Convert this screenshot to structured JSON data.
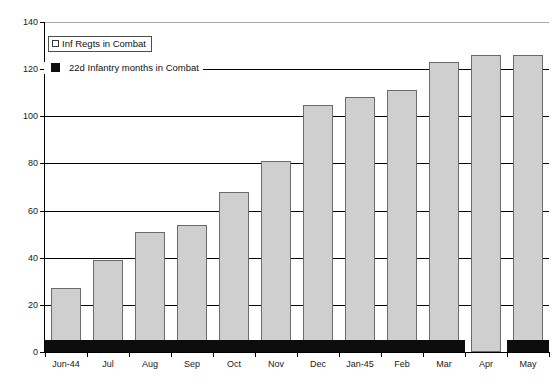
{
  "chart_data": {
    "type": "bar",
    "title": "",
    "subtitle": "",
    "xlabel": "",
    "ylabel": "",
    "ylim": [
      0,
      140
    ],
    "ytick_step": 20,
    "yticks": [
      0,
      20,
      40,
      60,
      80,
      100,
      120,
      140
    ],
    "ytick_labels": [
      "0",
      "20",
      "40",
      "60",
      "80",
      "100",
      "120",
      "140"
    ],
    "grid": true,
    "grid_axis": "y",
    "legend_position": "upper-left-inside",
    "categories": [
      "Jun-44",
      "Jul",
      "Aug",
      "Sep",
      "Oct",
      "Nov",
      "Dec",
      "Jan-45",
      "Feb",
      "Mar",
      "Apr",
      "May"
    ],
    "series": [
      {
        "name": "Inf Regts in Combat",
        "color": "#cfcfcf",
        "edge_color": "#6b6b6b",
        "values": [
          27,
          39,
          51,
          54,
          68,
          81,
          105,
          108,
          111,
          123,
          126,
          126
        ]
      },
      {
        "name": "22d Infantry months in Combat",
        "color": "#0d0d0d",
        "edge_color": "#0d0d0d",
        "values": [
          5,
          5,
          5,
          5,
          5,
          5,
          5,
          5,
          5,
          5,
          0,
          5
        ]
      }
    ]
  },
  "legend": {
    "boxed_entry": {
      "label": "Inf Regts in Combat",
      "swatch": "legend-swatch-open-square"
    },
    "plain_entry": {
      "label": "22d Infantry months in Combat",
      "swatch": "legend-swatch-filled-square"
    }
  },
  "colors": {
    "series_light": "#cfcfcf",
    "series_light_edge": "#6b6b6b",
    "series_dark": "#0d0d0d",
    "axis": "#000000",
    "grid": "#000000",
    "background": "#ffffff",
    "text": "#1a1a1a"
  }
}
